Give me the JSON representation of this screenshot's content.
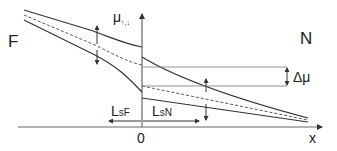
{
  "diagram": {
    "region_left_label": "F",
    "region_right_label": "N",
    "y_axis_label": "μ",
    "y_axis_subscript": "↑,↓",
    "x_axis_label": "x",
    "origin_label": "0",
    "delta_label": "Δμ",
    "lsf_label": "L",
    "lsf_subscript": "sF",
    "lsn_label": "L",
    "lsn_subscript": "sN",
    "colors": {
      "line": "#333333",
      "axis": "#555555",
      "thin": "#777777"
    }
  }
}
